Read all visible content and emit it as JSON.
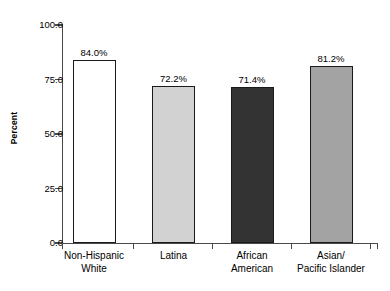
{
  "chart_data": {
    "type": "bar",
    "title": "",
    "xlabel": "",
    "ylabel": "Percent",
    "ylim": [
      0,
      100
    ],
    "grid": false,
    "legend": "none",
    "categories": [
      "Non-Hispanic\nWhite",
      "Latina",
      "African\nAmerican",
      "Asian/\nPacific Islander"
    ],
    "values": [
      84.0,
      72.2,
      71.4,
      81.2
    ],
    "value_labels": [
      "84.0%",
      "72.2%",
      "71.4%",
      "81.2%"
    ],
    "bar_colors": [
      "#ffffff",
      "#d2d2d2",
      "#333333",
      "#a3a3a3"
    ],
    "bar_edge_color": "#1a1a1a",
    "ytick_labels": [
      "100.0",
      "75.0",
      "50.0",
      "25.0",
      "0.0"
    ],
    "ytick_values": [
      100,
      75,
      50,
      25,
      0
    ],
    "axis_color": "#4a4a4a"
  }
}
